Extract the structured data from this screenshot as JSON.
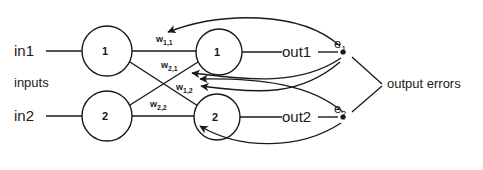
{
  "diagram": {
    "stroke_color": "#1a1a1a",
    "background_color": "#ffffff",
    "inputs_group_label": "inputs",
    "errors_group_label": "output errors",
    "input_labels": [
      {
        "name": "in1",
        "text": "in1"
      },
      {
        "name": "in2",
        "text": "in2"
      }
    ],
    "output_labels": [
      {
        "name": "out1",
        "text": "out1"
      },
      {
        "name": "out2",
        "text": "out2"
      }
    ],
    "input_nodes": [
      {
        "id": "input-node-1",
        "text": "1"
      },
      {
        "id": "input-node-2",
        "text": "2"
      }
    ],
    "output_nodes": [
      {
        "id": "output-node-1",
        "text": "1"
      },
      {
        "id": "output-node-2",
        "text": "2"
      }
    ],
    "error_nodes": [
      {
        "id": "error-node-1",
        "letter": "e",
        "sub": "1"
      },
      {
        "id": "error-node-2",
        "letter": "e",
        "sub": "2"
      }
    ],
    "weights": [
      {
        "id": "weight-1-1",
        "letter": "w",
        "sub": "1,1"
      },
      {
        "id": "weight-2-1",
        "letter": "w",
        "sub": "2,1"
      },
      {
        "id": "weight-1-2",
        "letter": "w",
        "sub": "1,2"
      },
      {
        "id": "weight-2-2",
        "letter": "w",
        "sub": "2,2"
      }
    ]
  }
}
